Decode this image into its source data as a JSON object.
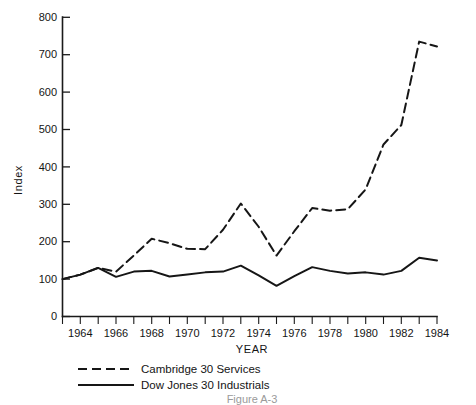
{
  "chart_data": {
    "type": "line",
    "title": "",
    "xlabel": "YEAR",
    "ylabel": "Index",
    "xlim": [
      1963,
      1984
    ],
    "ylim": [
      0,
      800
    ],
    "grid": false,
    "legend_position": "below-axes-left",
    "y_ticks": [
      0,
      100,
      200,
      300,
      400,
      500,
      600,
      700,
      800
    ],
    "y_tick_labels": [
      "0",
      "100",
      "200",
      "300",
      "400",
      "500",
      "600",
      "700",
      "800"
    ],
    "x_ticks": [
      1963,
      1964,
      1965,
      1966,
      1967,
      1968,
      1969,
      1970,
      1971,
      1972,
      1973,
      1974,
      1975,
      1976,
      1977,
      1978,
      1979,
      1980,
      1981,
      1982,
      1983,
      1984
    ],
    "x_tick_labels": [
      "",
      "1964",
      "",
      "1966",
      "",
      "1968",
      "",
      "1970",
      "",
      "1972",
      "",
      "1974",
      "",
      "1976",
      "",
      "1978",
      "",
      "1980",
      "",
      "1982",
      "",
      "1984"
    ],
    "x": [
      1963,
      1964,
      1965,
      1966,
      1967,
      1968,
      1969,
      1970,
      1971,
      1972,
      1973,
      1974,
      1975,
      1976,
      1977,
      1978,
      1979,
      1980,
      1981,
      1982,
      1983,
      1984
    ],
    "series": [
      {
        "name": "Cambridge 30 Services",
        "style": "dashed",
        "color": "#161616",
        "values": [
          100,
          112,
          130,
          120,
          163,
          208,
          196,
          181,
          180,
          232,
          302,
          240,
          163,
          228,
          290,
          283,
          287,
          340,
          460,
          512,
          735,
          722
        ]
      },
      {
        "name": "Dow Jones 30 Industrials",
        "style": "solid",
        "color": "#161616",
        "values": [
          100,
          112,
          130,
          106,
          120,
          122,
          107,
          112,
          118,
          120,
          136,
          110,
          82,
          108,
          132,
          122,
          115,
          118,
          112,
          122,
          157,
          150
        ]
      }
    ]
  },
  "legend": {
    "items": [
      {
        "label": "Cambridge 30 Services",
        "style": "dashed"
      },
      {
        "label": "Dow Jones 30 Industrials",
        "style": "solid"
      }
    ]
  },
  "caption": {
    "text": "Figure  A-3"
  }
}
